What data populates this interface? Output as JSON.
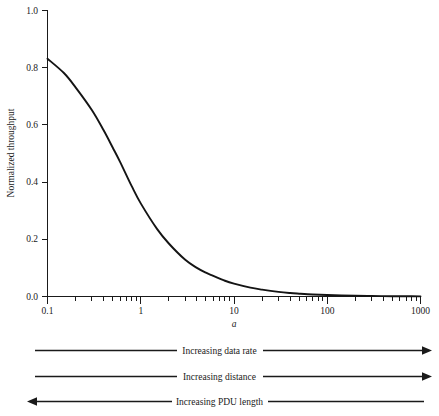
{
  "chart_data": {
    "type": "line",
    "title": "",
    "xlabel": "a",
    "ylabel": "Normalized throughput",
    "xscale": "log",
    "yscale": "linear",
    "xlim": [
      0.1,
      1000
    ],
    "ylim": [
      0.0,
      1.0
    ],
    "grid": false,
    "legend": "none",
    "x_tick_labels": [
      "0.1",
      "1",
      "10",
      "100",
      "1000"
    ],
    "x_tick_values": [
      0.1,
      1,
      10,
      100,
      1000
    ],
    "y_tick_labels": [
      "0.0",
      "0.2",
      "0.4",
      "0.6",
      "0.8",
      "1.0"
    ],
    "y_tick_values": [
      0.0,
      0.2,
      0.4,
      0.6,
      0.8,
      1.0
    ],
    "x_minor_ticks_per_decade": [
      2,
      3,
      4,
      5,
      6,
      7,
      8,
      9
    ],
    "series": [
      {
        "name": "Normalized throughput",
        "x": [
          0.1,
          0.15,
          0.2,
          0.3,
          0.4,
          0.5,
          0.6,
          0.8,
          1.0,
          1.5,
          2.0,
          3.0,
          4.0,
          5.0,
          6.0,
          8.0,
          10.0,
          15.0,
          20.0,
          30.0,
          40.0,
          50.0,
          70.0,
          100.0,
          200.0,
          300.0,
          500.0,
          700.0,
          1000.0
        ],
        "y": [
          0.83,
          0.78,
          0.73,
          0.65,
          0.58,
          0.52,
          0.47,
          0.385,
          0.325,
          0.235,
          0.185,
          0.128,
          0.1,
          0.083,
          0.072,
          0.055,
          0.045,
          0.031,
          0.024,
          0.016,
          0.012,
          0.0098,
          0.007,
          0.005,
          0.0025,
          0.0017,
          0.001,
          0.0007,
          0.0005
        ]
      }
    ]
  },
  "y_axis": {
    "label": "Normalized throughput",
    "ticks": [
      "0.0",
      "0.2",
      "0.4",
      "0.6",
      "0.8",
      "1.0"
    ]
  },
  "x_axis": {
    "label": "a",
    "ticks": [
      "0.1",
      "1",
      "10",
      "100",
      "1000"
    ]
  },
  "annotations": [
    {
      "label": "Increasing data rate",
      "direction": "right"
    },
    {
      "label": "Increasing distance",
      "direction": "right"
    },
    {
      "label": "Increasing PDU length",
      "direction": "left"
    }
  ]
}
